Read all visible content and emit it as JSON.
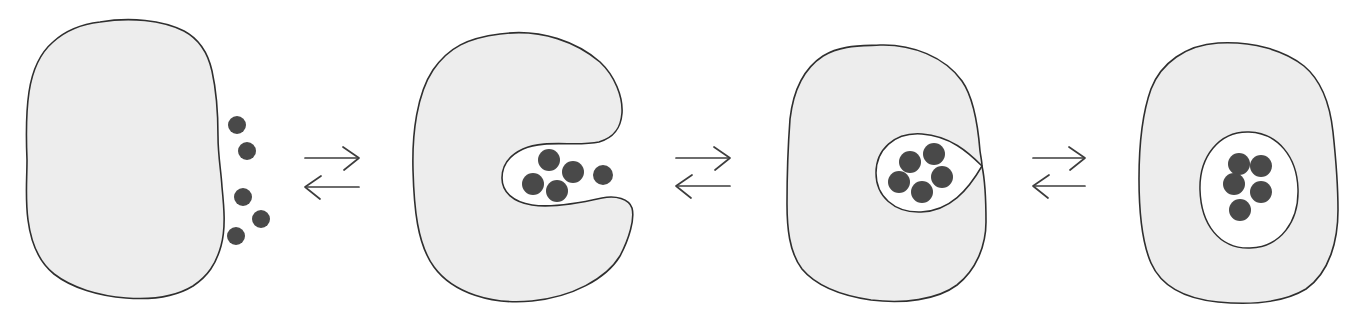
{
  "colors": {
    "background": "#ffffff",
    "body_fill": "#ededed",
    "body_stroke": "#2f2f2f",
    "cavity_fill": "#ffffff",
    "guest_fill": "#494949",
    "arrow_stroke": "#3d3d3d"
  },
  "stages": [
    {
      "name": "guests-free-outside-host",
      "guest_count": 5,
      "guest_location": "outside, at right edge of host",
      "dots": [
        {
          "x": 237,
          "y": 125,
          "r": 9
        },
        {
          "x": 247,
          "y": 151,
          "r": 9
        },
        {
          "x": 243,
          "y": 197,
          "r": 9
        },
        {
          "x": 261,
          "y": 219,
          "r": 9
        },
        {
          "x": 236,
          "y": 236,
          "r": 9
        }
      ]
    },
    {
      "name": "guests-entering-open-pocket",
      "guest_count": 5,
      "guest_location": "in open pocket at host mouth",
      "dots": [
        {
          "x": 549,
          "y": 160,
          "r": 11
        },
        {
          "x": 573,
          "y": 172,
          "r": 11
        },
        {
          "x": 533,
          "y": 184,
          "r": 11
        },
        {
          "x": 557,
          "y": 191,
          "r": 11
        },
        {
          "x": 603,
          "y": 175,
          "r": 10
        }
      ]
    },
    {
      "name": "guests-in-closing-cavity",
      "guest_count": 5,
      "guest_location": "inside teardrop cavity pinching shut",
      "dots": [
        {
          "x": 910,
          "y": 162,
          "r": 11
        },
        {
          "x": 934,
          "y": 154,
          "r": 11
        },
        {
          "x": 899,
          "y": 182,
          "r": 11
        },
        {
          "x": 922,
          "y": 192,
          "r": 11
        },
        {
          "x": 942,
          "y": 177,
          "r": 11
        }
      ]
    },
    {
      "name": "guests-fully-encapsulated",
      "guest_count": 5,
      "guest_location": "inside closed internal cavity",
      "dots": [
        {
          "x": 1239,
          "y": 164,
          "r": 11
        },
        {
          "x": 1261,
          "y": 166,
          "r": 11
        },
        {
          "x": 1234,
          "y": 184,
          "r": 11
        },
        {
          "x": 1261,
          "y": 192,
          "r": 11
        },
        {
          "x": 1240,
          "y": 210,
          "r": 11
        }
      ]
    }
  ],
  "equilibrium": {
    "style": "paired-open-arrows-forward-over-reverse",
    "head_length": 16,
    "head_spread": 11,
    "pairs": [
      {
        "x": 305,
        "width": 54,
        "top_y": 158,
        "bottom_y": 187
      },
      {
        "x": 676,
        "width": 54,
        "top_y": 158,
        "bottom_y": 186
      },
      {
        "x": 1033,
        "width": 52,
        "top_y": 158,
        "bottom_y": 186
      }
    ]
  }
}
